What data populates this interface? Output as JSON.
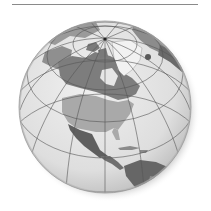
{
  "figure": {
    "style": "grayscale",
    "top_text_partially_visible": ""
  },
  "globe": {
    "cx": 105,
    "cy": 107,
    "r": 86,
    "pole": {
      "x": 105,
      "y": 39
    }
  },
  "colors": {
    "ocean": "#e2e2e2",
    "ocean_edge": "#bdbdbd",
    "canada": "#7d7d7d",
    "usa": "#a9a9a9",
    "mexico": "#5f5f5f",
    "central_america": "#6f6f6f",
    "greenland": "#f2f2f2",
    "arctic_land": "#9a9a9a",
    "south_america": "#666666",
    "gridline": "#555555",
    "shadow": "#9c9c9c"
  }
}
